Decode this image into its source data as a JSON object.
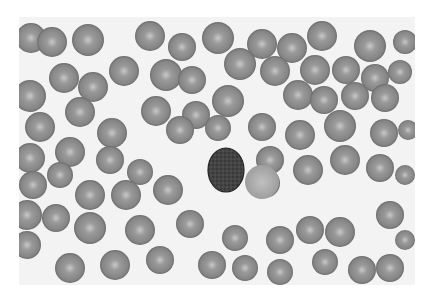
{
  "image": {
    "description": "Grayscale light micrograph of a blood smear showing many red blood cells with central pallor surrounding one dark stained nucleated cell",
    "background": "#f4f4f4",
    "cell_fill": "#8a8a8a",
    "cell_center": "#c4c4c4",
    "cell_edge": "#6e6e6e",
    "central_cell_fill": "#3c3c3c",
    "frame": {
      "x": 19,
      "y": 17,
      "w": 396,
      "h": 268
    }
  },
  "cells": [
    [
      31,
      38,
      15
    ],
    [
      52,
      42,
      15
    ],
    [
      88,
      40,
      16
    ],
    [
      150,
      36,
      15
    ],
    [
      182,
      47,
      14
    ],
    [
      218,
      38,
      16
    ],
    [
      262,
      44,
      15
    ],
    [
      292,
      48,
      15
    ],
    [
      322,
      36,
      15
    ],
    [
      370,
      46,
      16
    ],
    [
      405,
      42,
      12
    ],
    [
      30,
      96,
      16
    ],
    [
      64,
      78,
      15
    ],
    [
      93,
      87,
      15
    ],
    [
      124,
      71,
      15
    ],
    [
      166,
      75,
      16
    ],
    [
      192,
      80,
      14
    ],
    [
      240,
      64,
      16
    ],
    [
      275,
      71,
      15
    ],
    [
      315,
      70,
      15
    ],
    [
      346,
      70,
      14
    ],
    [
      375,
      78,
      14
    ],
    [
      400,
      72,
      12
    ],
    [
      40,
      127,
      15
    ],
    [
      80,
      112,
      15
    ],
    [
      112,
      133,
      15
    ],
    [
      156,
      111,
      15
    ],
    [
      196,
      115,
      14
    ],
    [
      228,
      101,
      16
    ],
    [
      262,
      127,
      14
    ],
    [
      298,
      95,
      15
    ],
    [
      324,
      100,
      14
    ],
    [
      355,
      96,
      14
    ],
    [
      385,
      98,
      14
    ],
    [
      30,
      158,
      15
    ],
    [
      70,
      152,
      15
    ],
    [
      110,
      160,
      14
    ],
    [
      140,
      172,
      13
    ],
    [
      180,
      130,
      14
    ],
    [
      218,
      128,
      13
    ],
    [
      270,
      160,
      14
    ],
    [
      300,
      135,
      15
    ],
    [
      340,
      126,
      16
    ],
    [
      384,
      133,
      14
    ],
    [
      408,
      130,
      10
    ],
    [
      33,
      185,
      14
    ],
    [
      60,
      175,
      13
    ],
    [
      90,
      195,
      15
    ],
    [
      126,
      195,
      15
    ],
    [
      168,
      190,
      15
    ],
    [
      265,
      183,
      15
    ],
    [
      308,
      170,
      15
    ],
    [
      345,
      160,
      15
    ],
    [
      380,
      168,
      14
    ],
    [
      405,
      175,
      10
    ],
    [
      27,
      215,
      15
    ],
    [
      56,
      218,
      14
    ],
    [
      90,
      228,
      16
    ],
    [
      140,
      230,
      15
    ],
    [
      190,
      224,
      14
    ],
    [
      235,
      238,
      13
    ],
    [
      280,
      240,
      14
    ],
    [
      310,
      230,
      14
    ],
    [
      340,
      232,
      15
    ],
    [
      390,
      215,
      14
    ],
    [
      405,
      240,
      10
    ],
    [
      27,
      245,
      14
    ],
    [
      70,
      268,
      15
    ],
    [
      115,
      265,
      15
    ],
    [
      160,
      260,
      14
    ],
    [
      212,
      265,
      14
    ],
    [
      245,
      268,
      13
    ],
    [
      280,
      272,
      13
    ],
    [
      325,
      262,
      13
    ],
    [
      362,
      270,
      14
    ],
    [
      390,
      268,
      14
    ]
  ],
  "central_cell": {
    "cx": 226,
    "cy": 170,
    "rx": 18,
    "ry": 22
  },
  "pale_cell": {
    "cx": 262,
    "cy": 182,
    "r": 17
  }
}
